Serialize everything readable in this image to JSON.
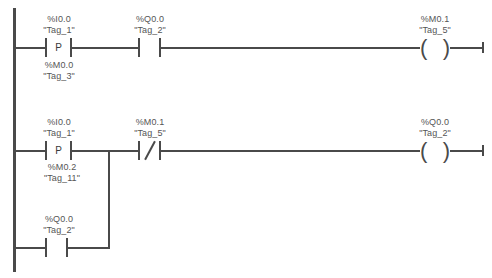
{
  "diagram": {
    "type": "ladder-logic",
    "language": "LAD",
    "line_color": "#4a4a4a",
    "text_color": "#555555",
    "background": "#ffffff"
  },
  "rungs": [
    {
      "id": "rung-1",
      "elements": [
        {
          "role": "positive-edge-contact",
          "symbol": "P",
          "address": "%I0.0",
          "tag": "\"Tag_1\"",
          "memory_address": "%M0.0",
          "memory_tag": "\"Tag_3\""
        },
        {
          "role": "normally-open-contact",
          "address": "%Q0.0",
          "tag": "\"Tag_2\""
        },
        {
          "role": "output-coil",
          "address": "%M0.1",
          "tag": "\"Tag_5\""
        }
      ]
    },
    {
      "id": "rung-2",
      "elements": [
        {
          "role": "positive-edge-contact",
          "symbol": "P",
          "address": "%I0.0",
          "tag": "\"Tag_1\"",
          "memory_address": "%M0.2",
          "memory_tag": "\"Tag_11\""
        },
        {
          "role": "normally-closed-contact",
          "address": "%M0.1",
          "tag": "\"Tag_5\""
        },
        {
          "role": "output-coil",
          "address": "%Q0.0",
          "tag": "\"Tag_2\""
        }
      ],
      "branch": {
        "id": "rung-2-branch",
        "role": "parallel-branch",
        "elements": [
          {
            "role": "normally-open-contact",
            "address": "%Q0.0",
            "tag": "\"Tag_2\""
          }
        ]
      }
    }
  ]
}
